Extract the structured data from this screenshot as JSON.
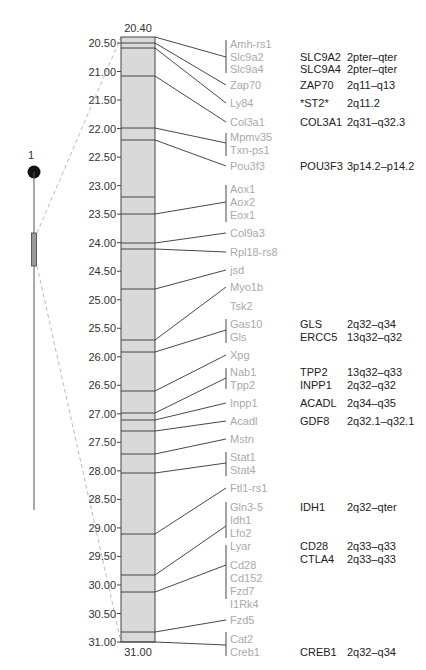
{
  "chromosome": {
    "label": "1"
  },
  "scale": {
    "top_label": "20.40",
    "bottom_label": "31.00",
    "ticks": [
      "20.50",
      "21.00",
      "21.50",
      "22.00",
      "22.50",
      "23.00",
      "23.50",
      "24.00",
      "24.50",
      "25.00",
      "25.50",
      "26.00",
      "26.50",
      "27.00",
      "27.50",
      "28.00",
      "28.50",
      "29.00",
      "29.50",
      "30.00",
      "30.50",
      "31.00"
    ]
  },
  "mouse_genes": [
    "Amh-rs1",
    "Slc9a2",
    "Slc9a4",
    "Zap70",
    "Ly84",
    "Col3a1",
    "Mpmv35",
    "Txn-ps1",
    "Pou3f3",
    "Aox1",
    "Aox2",
    "Eox1",
    "Col9a3",
    "Rpl18-rs8",
    "jsd",
    "Myo1b",
    "Tsk2",
    "Gas10",
    "Gls",
    "Xpg",
    "Nab1",
    "Tpp2",
    "Inpp1",
    "Acadl",
    "Mstn",
    "Stat1",
    "Stat4",
    "Ftl1-rs1",
    "Gln3-5",
    "Idh1",
    "Lfo2",
    "Lyar",
    "Cd28",
    "Cd152",
    "Fzd7",
    "I1Rk4",
    "Fzd5",
    "Cat2",
    "Creb1"
  ],
  "human_homologs": [
    {
      "gene": "SLC9A2",
      "locus": "2pter–qter"
    },
    {
      "gene": "SLC9A4",
      "locus": "2pter–qter"
    },
    {
      "gene": "ZAP70",
      "locus": "2q11–q13"
    },
    {
      "gene": "*ST2*",
      "locus": "2q11.2"
    },
    {
      "gene": "COL3A1",
      "locus": "2q31–q32.3"
    },
    {
      "gene": "POU3F3",
      "locus": "3p14.2–p14.2"
    },
    {
      "gene": "GLS",
      "locus": "2q32–q34"
    },
    {
      "gene": "ERCC5",
      "locus": "13q32–q32"
    },
    {
      "gene": "TPP2",
      "locus": "13q32–q33"
    },
    {
      "gene": "INPP1",
      "locus": "2q32–q32"
    },
    {
      "gene": "ACADL",
      "locus": "2q34–q35"
    },
    {
      "gene": "GDF8",
      "locus": "2q32.1–q32.1"
    },
    {
      "gene": "IDH1",
      "locus": "2q32–qter"
    },
    {
      "gene": "CD28",
      "locus": "2q33–q33"
    },
    {
      "gene": "CTLA4",
      "locus": "2q33–q33"
    },
    {
      "gene": "CREB1",
      "locus": "2q32–q34"
    }
  ],
  "colors": {
    "bar_fill": "#d9d9d9",
    "line": "#333333",
    "mouse_text": "#aaaaaa",
    "human_text": "#222222",
    "dashed": "#bbbbbb"
  }
}
